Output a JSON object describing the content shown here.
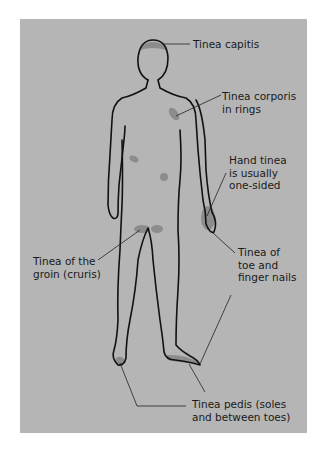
{
  "diagram": {
    "colors": {
      "background": "#b5b5b5",
      "outline": "#111111",
      "lesion": "#8a8a8a",
      "page": "#ffffff"
    },
    "labels": [
      {
        "id": "capitis",
        "lines": [
          "Tinea capitis"
        ]
      },
      {
        "id": "corporis",
        "lines": [
          "Tinea corporis",
          "in rings"
        ]
      },
      {
        "id": "hand",
        "lines": [
          "Hand tinea",
          "is usually",
          "one-sided"
        ]
      },
      {
        "id": "groin",
        "lines": [
          "Tinea of the",
          "groin (cruris)"
        ]
      },
      {
        "id": "nails",
        "lines": [
          "Tinea of",
          "toe and",
          "finger nails"
        ]
      },
      {
        "id": "pedis",
        "lines": [
          "Tinea pedis (soles",
          "and between toes)"
        ]
      }
    ]
  }
}
